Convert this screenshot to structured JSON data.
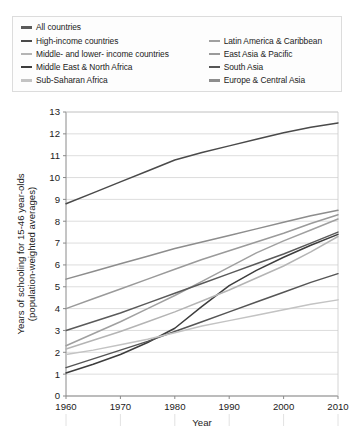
{
  "legend": {
    "left_column": [
      {
        "label": "All countries",
        "color": "#5a5a5a"
      },
      {
        "label": "High-income countries",
        "color": "#4a4a4a"
      },
      {
        "label": "Middle- and lower- income countries",
        "color": "#b4b4b4"
      },
      {
        "label": "Middle East & North Africa",
        "color": "#3d3d3d"
      },
      {
        "label": "Sub-Saharan Africa",
        "color": "#c3c3c3"
      }
    ],
    "right_column": [
      {
        "label": "Latin America & Caribbean",
        "color": "#a0a0a0"
      },
      {
        "label": "East Asia & Pacific",
        "color": "#9a9a9a"
      },
      {
        "label": "South Asia",
        "color": "#555555"
      },
      {
        "label": "Europe & Central Asia",
        "color": "#8d8d8d"
      }
    ]
  },
  "chart_data": {
    "type": "line",
    "title": "",
    "xlabel": "Year",
    "ylabel": "Years of schooling for 15-46 year-olds (population-weighted averages)",
    "ylabel_line1": "Years of schooling for 15-46 year-olds",
    "ylabel_line2": "(population-weighted averages)",
    "x": [
      1960,
      1965,
      1970,
      1975,
      1980,
      1985,
      1990,
      1995,
      2000,
      2005,
      2010
    ],
    "xticks": [
      "1960",
      "1970",
      "1980",
      "1990",
      "2000",
      "2010"
    ],
    "xtick_values": [
      1960,
      1970,
      1980,
      1990,
      2000,
      2010
    ],
    "yticks": [
      "0",
      "1",
      "2",
      "3",
      "4",
      "5",
      "6",
      "7",
      "8",
      "9",
      "10",
      "11",
      "12",
      "13"
    ],
    "ytick_values": [
      0,
      1,
      2,
      3,
      4,
      5,
      6,
      7,
      8,
      9,
      10,
      11,
      12,
      13
    ],
    "xlim": [
      1960,
      2010
    ],
    "ylim": [
      0,
      13
    ],
    "grid": true,
    "grid_axis": "y",
    "legend_position": "above",
    "series": [
      {
        "name": "High-income countries",
        "color": "#4a4a4a",
        "values": [
          8.8,
          9.3,
          9.8,
          10.3,
          10.8,
          11.15,
          11.45,
          11.75,
          12.05,
          12.3,
          12.5
        ]
      },
      {
        "name": "Europe & Central Asia",
        "color": "#8d8d8d",
        "values": [
          5.35,
          5.7,
          6.05,
          6.4,
          6.75,
          7.05,
          7.35,
          7.65,
          7.95,
          8.25,
          8.5
        ]
      },
      {
        "name": "East Asia & Pacific",
        "color": "#9a9a9a",
        "values": [
          4.0,
          4.45,
          4.9,
          5.35,
          5.8,
          6.25,
          6.65,
          7.05,
          7.45,
          7.9,
          8.3
        ]
      },
      {
        "name": "Latin America & Caribbean",
        "color": "#a0a0a0",
        "values": [
          2.3,
          2.85,
          3.4,
          4.0,
          4.6,
          5.25,
          5.9,
          6.55,
          7.1,
          7.6,
          8.1
        ]
      },
      {
        "name": "All countries",
        "color": "#5a5a5a",
        "values": [
          3.0,
          3.4,
          3.8,
          4.25,
          4.7,
          5.15,
          5.6,
          6.05,
          6.5,
          7.0,
          7.5
        ]
      },
      {
        "name": "Middle East & North Africa",
        "color": "#3d3d3d",
        "values": [
          1.05,
          1.45,
          1.9,
          2.45,
          3.1,
          4.1,
          5.05,
          5.75,
          6.35,
          6.9,
          7.4
        ]
      },
      {
        "name": "Middle- and lower- income countries",
        "color": "#b4b4b4",
        "values": [
          2.15,
          2.55,
          2.95,
          3.4,
          3.85,
          4.35,
          4.85,
          5.4,
          5.95,
          6.6,
          7.3
        ]
      },
      {
        "name": "South Asia",
        "color": "#555555",
        "values": [
          1.3,
          1.7,
          2.1,
          2.5,
          2.95,
          3.4,
          3.85,
          4.3,
          4.75,
          5.2,
          5.6
        ]
      },
      {
        "name": "Sub-Saharan Africa",
        "color": "#c3c3c3",
        "values": [
          1.9,
          2.1,
          2.35,
          2.6,
          2.9,
          3.2,
          3.45,
          3.7,
          3.95,
          4.2,
          4.4
        ]
      }
    ]
  }
}
